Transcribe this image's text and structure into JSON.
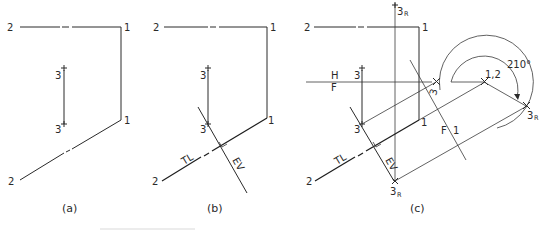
{
  "figure": {
    "panels": [
      {
        "id": "a",
        "caption": "(a)",
        "labels": {
          "p2_top": "2",
          "p1_top": "1",
          "p3_top": "3",
          "p3_bottom": "3",
          "p1_mid": "1",
          "p2_bottom": "2"
        }
      },
      {
        "id": "b",
        "caption": "(b)",
        "labels": {
          "p2_top": "2",
          "p1_top": "1",
          "p3_top": "3",
          "p3_bottom": "3",
          "p1_mid": "1",
          "p2_bottom": "2",
          "tl": "TL",
          "ev": "EV"
        }
      },
      {
        "id": "c",
        "caption": "(c)",
        "labels": {
          "p2_top": "2",
          "p1_top": "1",
          "p3_top": "3",
          "p3_bottom": "3",
          "p1_mid": "1",
          "p2_bottom": "2",
          "tl": "TL",
          "ev": "EV",
          "h": "H",
          "f": "F",
          "f_right": "F",
          "one_right": "1",
          "p3r_top": "3",
          "p3r_top_sub": "R",
          "p3r_bottom": "3",
          "p3r_bottom_sub": "R",
          "p3_aux": "3",
          "p12": "1,2",
          "p3r_right": "3",
          "p3r_right_sub": "R",
          "angle": "210°"
        }
      }
    ]
  }
}
